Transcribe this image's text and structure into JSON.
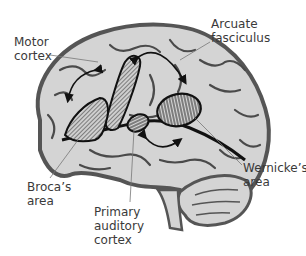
{
  "diagram": {
    "labels": {
      "motor_cortex": "Motor\ncortex",
      "arcuate_fasciculus": "Arcuate\nfasciculus",
      "brocas_area": "Broca’s\narea",
      "primary_auditory_cortex": "Primary\nauditory\ncortex",
      "wernickes_area": "Wernicke’s\narea"
    },
    "colors": {
      "brain_fill": "#d4d4d4",
      "sulci": "#4a4a4a",
      "outline": "#555555",
      "region_outline": "#111111",
      "hatch": "#2a2a2a",
      "label_text": "#3a3a3a",
      "leader_line": "#777777"
    }
  }
}
